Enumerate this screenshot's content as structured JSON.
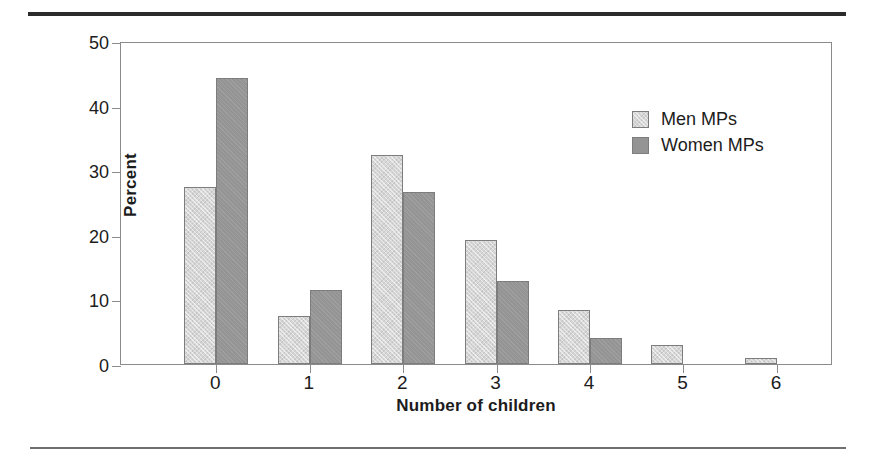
{
  "chart_data": {
    "type": "bar",
    "title": "",
    "xlabel": "Number of children",
    "ylabel": "Percent",
    "categories": [
      "0",
      "1",
      "2",
      "3",
      "4",
      "5",
      "6"
    ],
    "series": [
      {
        "name": "Men MPs",
        "color": "#d6d6d6",
        "values": [
          27.4,
          7.5,
          32.3,
          19.2,
          8.4,
          2.9,
          0.9
        ]
      },
      {
        "name": "Women MPs",
        "color": "#949494",
        "values": [
          44.2,
          11.5,
          26.6,
          12.8,
          4.0,
          0,
          0
        ]
      }
    ],
    "ylim": [
      0,
      50
    ],
    "yticks": [
      0,
      10,
      20,
      30,
      40,
      50
    ],
    "ytick_labels": [
      "0",
      "10",
      "20",
      "30",
      "40",
      "50"
    ],
    "grid": false,
    "legend_position": "upper right"
  },
  "legend": {
    "entries": [
      {
        "label": "Men MPs"
      },
      {
        "label": "Women MPs"
      }
    ]
  },
  "axes": {
    "y_title": "Percent",
    "x_title": "Number of children"
  },
  "colors": {
    "men_fill": "#d6d6d6",
    "women_fill": "#949494",
    "bar_outline": "#7d7d7d",
    "frame": "#8b8b8b",
    "rule_top": "#2b2b2b",
    "rule_bottom": "#6f6f6f",
    "text": "#1c1c1c"
  }
}
